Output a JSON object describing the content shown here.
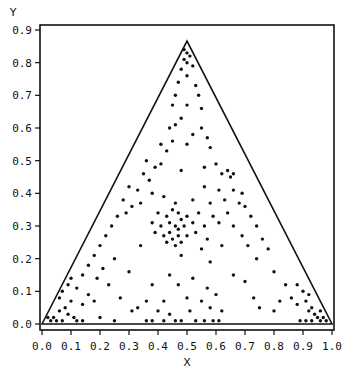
{
  "chart_data": {
    "type": "scatter",
    "title": "",
    "xlabel": "X",
    "ylabel": "Y",
    "xlim": [
      0.0,
      1.0
    ],
    "ylim": [
      0.0,
      0.9
    ],
    "x_ticks": [
      "0.0",
      "0.1",
      "0.2",
      "0.3",
      "0.4",
      "0.5",
      "0.6",
      "0.7",
      "0.8",
      "0.9",
      "1.0"
    ],
    "y_ticks": [
      "0.0",
      "0.1",
      "0.2",
      "0.3",
      "0.4",
      "0.5",
      "0.6",
      "0.7",
      "0.8",
      "0.9"
    ],
    "grid": false,
    "legend": null,
    "overlay_shape": {
      "type": "triangle",
      "vertices": [
        [
          0.0,
          0.0
        ],
        [
          0.5,
          0.866
        ],
        [
          1.0,
          0.0
        ]
      ]
    },
    "series": [
      {
        "name": "points",
        "marker": "dot",
        "color": "#111111",
        "points": [
          [
            0.49,
            0.84
          ],
          [
            0.5,
            0.83
          ],
          [
            0.51,
            0.82
          ],
          [
            0.49,
            0.81
          ],
          [
            0.5,
            0.8
          ],
          [
            0.52,
            0.79
          ],
          [
            0.48,
            0.78
          ],
          [
            0.5,
            0.76
          ],
          [
            0.47,
            0.74
          ],
          [
            0.53,
            0.73
          ],
          [
            0.46,
            0.7
          ],
          [
            0.54,
            0.7
          ],
          [
            0.45,
            0.67
          ],
          [
            0.55,
            0.66
          ],
          [
            0.5,
            0.67
          ],
          [
            0.48,
            0.63
          ],
          [
            0.44,
            0.6
          ],
          [
            0.46,
            0.61
          ],
          [
            0.52,
            0.58
          ],
          [
            0.55,
            0.6
          ],
          [
            0.57,
            0.57
          ],
          [
            0.41,
            0.55
          ],
          [
            0.45,
            0.56
          ],
          [
            0.5,
            0.55
          ],
          [
            0.43,
            0.53
          ],
          [
            0.58,
            0.54
          ],
          [
            0.36,
            0.5
          ],
          [
            0.39,
            0.48
          ],
          [
            0.41,
            0.49
          ],
          [
            0.56,
            0.48
          ],
          [
            0.6,
            0.49
          ],
          [
            0.62,
            0.46
          ],
          [
            0.35,
            0.46
          ],
          [
            0.37,
            0.44
          ],
          [
            0.48,
            0.47
          ],
          [
            0.64,
            0.47
          ],
          [
            0.65,
            0.45
          ],
          [
            0.66,
            0.46
          ],
          [
            0.3,
            0.42
          ],
          [
            0.33,
            0.41
          ],
          [
            0.38,
            0.4
          ],
          [
            0.56,
            0.42
          ],
          [
            0.61,
            0.41
          ],
          [
            0.66,
            0.41
          ],
          [
            0.69,
            0.4
          ],
          [
            0.28,
            0.38
          ],
          [
            0.31,
            0.36
          ],
          [
            0.34,
            0.37
          ],
          [
            0.42,
            0.39
          ],
          [
            0.46,
            0.37
          ],
          [
            0.52,
            0.38
          ],
          [
            0.58,
            0.37
          ],
          [
            0.63,
            0.38
          ],
          [
            0.68,
            0.37
          ],
          [
            0.7,
            0.36
          ],
          [
            0.26,
            0.33
          ],
          [
            0.29,
            0.34
          ],
          [
            0.4,
            0.34
          ],
          [
            0.43,
            0.33
          ],
          [
            0.45,
            0.35
          ],
          [
            0.47,
            0.34
          ],
          [
            0.48,
            0.32
          ],
          [
            0.5,
            0.33
          ],
          [
            0.54,
            0.34
          ],
          [
            0.59,
            0.33
          ],
          [
            0.64,
            0.34
          ],
          [
            0.72,
            0.33
          ],
          [
            0.24,
            0.3
          ],
          [
            0.38,
            0.31
          ],
          [
            0.41,
            0.3
          ],
          [
            0.44,
            0.31
          ],
          [
            0.46,
            0.3
          ],
          [
            0.47,
            0.29
          ],
          [
            0.49,
            0.3
          ],
          [
            0.52,
            0.31
          ],
          [
            0.56,
            0.3
          ],
          [
            0.61,
            0.31
          ],
          [
            0.66,
            0.3
          ],
          [
            0.74,
            0.3
          ],
          [
            0.22,
            0.27
          ],
          [
            0.39,
            0.28
          ],
          [
            0.42,
            0.27
          ],
          [
            0.44,
            0.28
          ],
          [
            0.45,
            0.26
          ],
          [
            0.47,
            0.27
          ],
          [
            0.5,
            0.27
          ],
          [
            0.53,
            0.28
          ],
          [
            0.57,
            0.26
          ],
          [
            0.69,
            0.27
          ],
          [
            0.76,
            0.26
          ],
          [
            0.2,
            0.24
          ],
          [
            0.34,
            0.24
          ],
          [
            0.43,
            0.25
          ],
          [
            0.46,
            0.24
          ],
          [
            0.48,
            0.25
          ],
          [
            0.55,
            0.23
          ],
          [
            0.62,
            0.24
          ],
          [
            0.71,
            0.24
          ],
          [
            0.78,
            0.23
          ],
          [
            0.18,
            0.21
          ],
          [
            0.25,
            0.2
          ],
          [
            0.48,
            0.21
          ],
          [
            0.58,
            0.19
          ],
          [
            0.74,
            0.2
          ],
          [
            0.16,
            0.18
          ],
          [
            0.21,
            0.17
          ],
          [
            0.3,
            0.16
          ],
          [
            0.44,
            0.15
          ],
          [
            0.52,
            0.14
          ],
          [
            0.66,
            0.15
          ],
          [
            0.8,
            0.16
          ],
          [
            0.14,
            0.15
          ],
          [
            0.19,
            0.14
          ],
          [
            0.23,
            0.12
          ],
          [
            0.38,
            0.12
          ],
          [
            0.47,
            0.12
          ],
          [
            0.57,
            0.11
          ],
          [
            0.7,
            0.13
          ],
          [
            0.84,
            0.12
          ],
          [
            0.12,
            0.11
          ],
          [
            0.16,
            0.09
          ],
          [
            0.27,
            0.08
          ],
          [
            0.36,
            0.07
          ],
          [
            0.42,
            0.07
          ],
          [
            0.5,
            0.08
          ],
          [
            0.55,
            0.07
          ],
          [
            0.6,
            0.09
          ],
          [
            0.73,
            0.08
          ],
          [
            0.82,
            0.07
          ],
          [
            0.86,
            0.08
          ],
          [
            0.1,
            0.07
          ],
          [
            0.14,
            0.06
          ],
          [
            0.18,
            0.07
          ],
          [
            0.31,
            0.04
          ],
          [
            0.33,
            0.05
          ],
          [
            0.4,
            0.04
          ],
          [
            0.44,
            0.03
          ],
          [
            0.51,
            0.04
          ],
          [
            0.58,
            0.05
          ],
          [
            0.62,
            0.04
          ],
          [
            0.75,
            0.05
          ],
          [
            0.8,
            0.04
          ],
          [
            0.88,
            0.06
          ],
          [
            0.91,
            0.07
          ],
          [
            0.93,
            0.05
          ],
          [
            0.08,
            0.05
          ],
          [
            0.06,
            0.04
          ],
          [
            0.09,
            0.03
          ],
          [
            0.11,
            0.02
          ],
          [
            0.04,
            0.02
          ],
          [
            0.05,
            0.01
          ],
          [
            0.03,
            0.01
          ],
          [
            0.07,
            0.01
          ],
          [
            0.12,
            0.01
          ],
          [
            0.14,
            0.01
          ],
          [
            0.2,
            0.02
          ],
          [
            0.25,
            0.01
          ],
          [
            0.36,
            0.01
          ],
          [
            0.38,
            0.01
          ],
          [
            0.42,
            0.01
          ],
          [
            0.46,
            0.01
          ],
          [
            0.48,
            0.01
          ],
          [
            0.53,
            0.01
          ],
          [
            0.56,
            0.01
          ],
          [
            0.59,
            0.01
          ],
          [
            0.61,
            0.01
          ],
          [
            0.89,
            0.01
          ],
          [
            0.91,
            0.01
          ],
          [
            0.93,
            0.01
          ],
          [
            0.95,
            0.02
          ],
          [
            0.96,
            0.01
          ],
          [
            0.97,
            0.02
          ],
          [
            0.98,
            0.01
          ],
          [
            0.94,
            0.03
          ],
          [
            0.92,
            0.04
          ],
          [
            0.96,
            0.04
          ],
          [
            0.9,
            0.1
          ],
          [
            0.92,
            0.09
          ],
          [
            0.88,
            0.12
          ],
          [
            0.06,
            0.08
          ],
          [
            0.07,
            0.1
          ],
          [
            0.09,
            0.12
          ],
          [
            0.1,
            0.14
          ],
          [
            0.02,
            0.02
          ]
        ]
      }
    ]
  }
}
